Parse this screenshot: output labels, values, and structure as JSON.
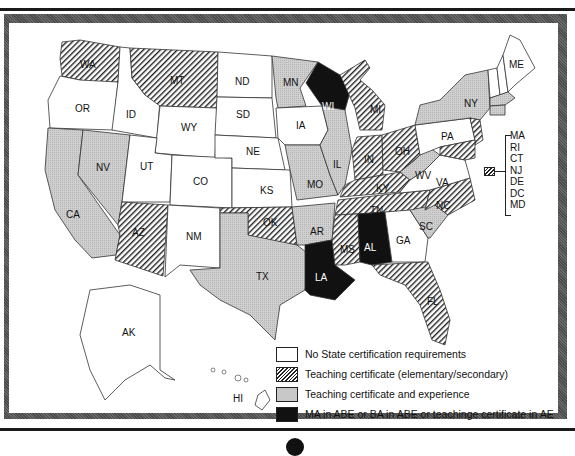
{
  "map": {
    "legend": [
      {
        "key": "none",
        "label": "No State certification requirements",
        "color": "#ffffff",
        "pattern": "solid"
      },
      {
        "key": "hatch",
        "label": "Teaching certificate (elementary/secondary)",
        "color": "#222222",
        "pattern": "diagonal-hatch"
      },
      {
        "key": "gray",
        "label": "Teaching certificate and experience",
        "color": "#c8c8c8",
        "pattern": "stipple"
      },
      {
        "key": "black",
        "label": "MA in ABE or BA in ABE or teachinge certificate in AE",
        "color": "#111111",
        "pattern": "solid"
      }
    ],
    "states": {
      "WA": "hatch",
      "OR": "none",
      "CA": "gray",
      "ID": "none",
      "NV": "gray",
      "MT": "hatch",
      "WY": "none",
      "UT": "none",
      "AZ": "hatch",
      "CO": "none",
      "NM": "none",
      "ND": "none",
      "SD": "none",
      "NE": "none",
      "KS": "none",
      "OK": "hatch",
      "TX": "gray",
      "MN": "gray",
      "IA": "none",
      "MO": "gray",
      "AR": "gray",
      "LA": "black",
      "WI": "black",
      "IL": "gray",
      "MI": "hatch",
      "IN": "hatch",
      "OH": "hatch",
      "KY": "hatch",
      "TN": "hatch",
      "MS": "hatch",
      "AL": "black",
      "GA": "none",
      "FL": "hatch",
      "SC": "gray",
      "NC": "hatch",
      "VA": "none",
      "WV": "gray",
      "PA": "none",
      "NY": "gray",
      "ME": "none",
      "VT": "none",
      "NH": "none",
      "AK": "none",
      "HI": "none",
      "MA": "hatch",
      "RI": "hatch",
      "CT": "hatch",
      "NJ": "hatch",
      "DE": "hatch",
      "DC": "hatch",
      "MD": "hatch"
    },
    "northeast_callout": {
      "category": "hatch",
      "states": [
        "MA",
        "RI",
        "CT",
        "NJ",
        "DE",
        "DC",
        "MD"
      ]
    },
    "labels": {
      "WA": "WA",
      "OR": "OR",
      "CA": "CA",
      "ID": "ID",
      "NV": "NV",
      "MT": "MT",
      "WY": "WY",
      "UT": "UT",
      "AZ": "AZ",
      "CO": "CO",
      "NM": "NM",
      "ND": "ND",
      "SD": "SD",
      "NE": "NE",
      "KS": "KS",
      "OK": "OK",
      "TX": "TX",
      "MN": "MN",
      "IA": "IA",
      "MO": "MO",
      "AR": "AR",
      "LA": "LA",
      "WI": "WI",
      "IL": "IL",
      "MI": "MI",
      "IN": "IN",
      "OH": "OH",
      "KY": "KY",
      "TN": "TN",
      "MS": "MS",
      "AL": "AL",
      "GA": "GA",
      "FL": "FL",
      "SC": "SC",
      "NC": "NC",
      "VA": "VA",
      "WV": "WV",
      "PA": "PA",
      "NY": "NY",
      "ME": "ME",
      "AK": "AK",
      "HI": "HI"
    }
  }
}
